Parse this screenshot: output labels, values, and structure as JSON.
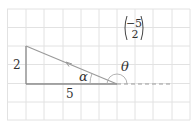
{
  "diagram": {
    "vector": {
      "top": "−5",
      "bottom": "2"
    },
    "labels": {
      "vertical_side": "2",
      "horizontal_side": "5",
      "alpha": "α",
      "theta": "θ"
    },
    "colors": {
      "grid": "#e2e2e2",
      "triangle": "#8a8a8a",
      "hypotenuse": "#999999",
      "dashed": "#9a9a9a",
      "text": "#333333"
    }
  }
}
